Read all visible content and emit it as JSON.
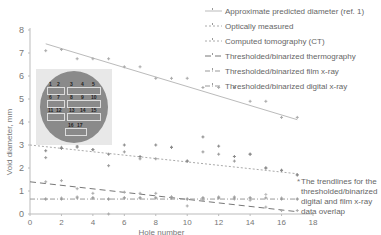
{
  "chart_data": {
    "type": "scatter",
    "title": "",
    "xlabel": "Hole number",
    "ylabel": "Void diameter, mm",
    "xlim": [
      0,
      18
    ],
    "ylim": [
      0,
      8
    ],
    "x_ticks": [
      "0",
      "2",
      "4",
      "6",
      "8",
      "10",
      "12",
      "14",
      "16",
      "18"
    ],
    "y_ticks": [
      "0",
      "1",
      "2",
      "3",
      "4",
      "5",
      "6",
      "7",
      "8"
    ],
    "grid": false,
    "legend_position": "top-right",
    "series": [
      {
        "name": "Approximate predicted diameter (ref. 1)",
        "x": [
          1,
          2,
          3,
          4,
          5,
          6,
          7,
          8,
          9,
          10,
          11,
          12,
          13,
          14,
          15,
          16,
          17
        ],
        "values": [
          7.1,
          7.15,
          6.75,
          6.75,
          6.75,
          6.4,
          6.4,
          5.9,
          5.9,
          5.9,
          5.5,
          5.5,
          5.5,
          4.9,
          4.9,
          4.2,
          4.2
        ]
      },
      {
        "name": "Optically measured",
        "x": [
          1,
          2,
          3,
          4,
          5,
          6,
          7,
          8,
          9,
          10,
          11,
          12,
          13,
          14,
          15,
          16,
          17
        ],
        "values": [
          2.45,
          2.9,
          2.9,
          2.8,
          2.1,
          2.7,
          2.4,
          2.4,
          2.9,
          2.3,
          2.7,
          2.6,
          2.3,
          2.6,
          2.0,
          1.9,
          1.7
        ]
      },
      {
        "name": "Computed tomography (CT)",
        "x": [
          1,
          2,
          3,
          4,
          5,
          6,
          7,
          8,
          9,
          10,
          11,
          12,
          13,
          14,
          15,
          16,
          17
        ],
        "values": [
          2.75,
          2.85,
          2.95,
          2.8,
          2.6,
          3.0,
          2.5,
          3.0,
          2.9,
          2.3,
          3.35,
          2.95,
          2.5,
          2.6,
          2.0,
          1.9,
          1.7
        ]
      },
      {
        "name": "Thresholded/binarized thermography",
        "x": [
          1,
          2,
          3,
          4,
          5,
          6,
          7,
          8,
          9,
          10,
          11,
          12,
          13,
          14,
          15,
          16,
          17
        ],
        "values": [
          1.4,
          1.45,
          1.1,
          0.9,
          0.0,
          0.95,
          0.9,
          0.9,
          0.75,
          0.35,
          0.6,
          0.7,
          0.65,
          0.6,
          0.3,
          0.15,
          0.15
        ]
      },
      {
        "name": "Thresholded/binarized film x-ray",
        "x": [
          1,
          2,
          3,
          4,
          5,
          6,
          7,
          8,
          9,
          10,
          11,
          12,
          13,
          14,
          15,
          16,
          17
        ],
        "values": [
          0.65,
          0.7,
          0.75,
          0.7,
          0.65,
          0.7,
          0.7,
          0.7,
          0.7,
          0.65,
          0.7,
          0.75,
          0.75,
          0.7,
          0.85,
          0.7,
          0.65
        ]
      },
      {
        "name": "Thresholded/binarized digital x-ray",
        "x": [
          1,
          2,
          3,
          4,
          5,
          6,
          7,
          8,
          9,
          10,
          11,
          12,
          13,
          14,
          15,
          16,
          17
        ],
        "values": [
          0.65,
          0.65,
          0.7,
          0.7,
          0.65,
          0.7,
          0.7,
          0.7,
          0.7,
          0.65,
          0.7,
          0.7,
          0.7,
          0.7,
          0.7,
          0.65,
          0.65
        ]
      }
    ],
    "trendlines": [
      {
        "series": "Approximate predicted diameter (ref. 1)",
        "from": [
          1,
          7.4
        ],
        "to": [
          17,
          4.1
        ]
      },
      {
        "series": "Optically measured / CT",
        "from": [
          0,
          3.0
        ],
        "to": [
          17,
          1.75
        ]
      },
      {
        "series": "Thresholded/binarized thermography",
        "from": [
          0,
          1.4
        ],
        "to": [
          17,
          0.1
        ]
      },
      {
        "series": "Thresholded/binarized film & digital x-ray",
        "from": [
          0,
          0.65
        ],
        "to": [
          17,
          0.65
        ]
      }
    ],
    "annotations": [
      "The trendlines for the thresholded/binarized digital and film x-ray data overlap"
    ]
  },
  "axes": {
    "xlabel": "Hole number",
    "ylabel": "Void diameter, mm",
    "x_ticks": [
      "0",
      "2",
      "4",
      "6",
      "8",
      "10",
      "12",
      "14",
      "16",
      "18"
    ],
    "y_ticks": [
      "0",
      "1",
      "2",
      "3",
      "4",
      "5",
      "6",
      "7",
      "8"
    ]
  },
  "legend": [
    "Approximate predicted diameter (ref. 1)",
    "Optically measured",
    "Computed tomography (CT)",
    "Thresholded/binarized thermography",
    "Thresholded/binarized film x-ray",
    "Thresholded/binarized digital x-ray"
  ],
  "note": "The trendlines for the thresholded/binarized digital and film x-ray data overlap",
  "photo": {
    "hole_labels": [
      "1",
      "2",
      "3",
      "4",
      "5",
      "6",
      "7",
      "8",
      "9",
      "10",
      "11",
      "12",
      "13",
      "14",
      "15",
      "16",
      "17"
    ],
    "side_labels": [
      "A",
      "B",
      "C",
      "D",
      "E",
      "F"
    ]
  }
}
